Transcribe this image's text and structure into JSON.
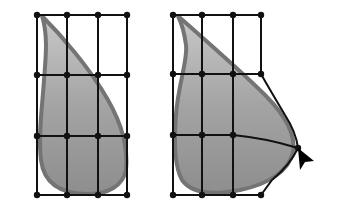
{
  "diagram": {
    "colors": {
      "background": "#ffffff",
      "grid": "#111111",
      "shape_fill": "#9a9a9a",
      "shape_fill_light": "#c4c4c4",
      "shape_outline": "#6e6e6e",
      "cursor": "#000000"
    },
    "panels": [
      {
        "id": "original",
        "grid_cols": [
          37,
          67,
          98,
          127
        ],
        "grid_rows": [
          15,
          75,
          136,
          195
        ]
      },
      {
        "id": "deformed",
        "grid_cols": [
          173,
          202,
          233,
          261
        ],
        "grid_rows": [
          15,
          74,
          135,
          195
        ],
        "dragged_point": [
          298,
          148
        ],
        "cursor": "arrow-pointer"
      }
    ]
  }
}
